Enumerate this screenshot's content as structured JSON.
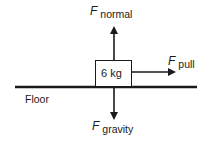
{
  "diagram": {
    "type": "free-body diagram",
    "block": {
      "label": "6 kg"
    },
    "floor": {
      "label": "Floor"
    },
    "forces": [
      {
        "id": "normal",
        "symbol": "F",
        "subscript": "normal",
        "direction": "up"
      },
      {
        "id": "pull",
        "symbol": "F",
        "subscript": "pull",
        "direction": "right"
      },
      {
        "id": "gravity",
        "symbol": "F",
        "subscript": "gravity",
        "direction": "down"
      }
    ]
  },
  "colors": {
    "ink": "#1a1a1a",
    "background": "#ffffff"
  }
}
